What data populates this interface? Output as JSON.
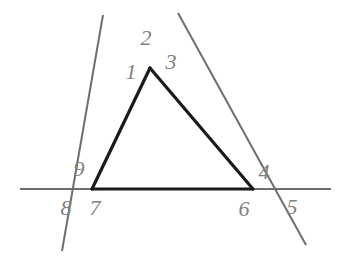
{
  "figure": {
    "background_color": "#ffffff",
    "triangle_color": "#1a1a1a",
    "line_color": "#6e6e6e",
    "label_color": "#808080",
    "triangle": {
      "apex": {
        "x": 150,
        "y": 68
      },
      "bottom_left": {
        "x": 92,
        "y": 189
      },
      "bottom_right": {
        "x": 253,
        "y": 189
      }
    },
    "lines": [
      {
        "name": "horizontal-base-line",
        "x1": 20,
        "y1": 189,
        "x2": 331,
        "y2": 189
      },
      {
        "name": "left-transversal-line",
        "x1": 103,
        "y1": 15,
        "x2": 62,
        "y2": 251
      },
      {
        "name": "right-transversal-line",
        "x1": 178,
        "y1": 13,
        "x2": 306,
        "y2": 245
      }
    ],
    "labels": [
      {
        "text": "1",
        "x": 131,
        "y": 72
      },
      {
        "text": "2",
        "x": 146,
        "y": 38
      },
      {
        "text": "3",
        "x": 171,
        "y": 62
      },
      {
        "text": "4",
        "x": 264,
        "y": 172
      },
      {
        "text": "5",
        "x": 292,
        "y": 207
      },
      {
        "text": "6",
        "x": 244,
        "y": 209
      },
      {
        "text": "7",
        "x": 95,
        "y": 208
      },
      {
        "text": "8",
        "x": 66,
        "y": 208
      },
      {
        "text": "9",
        "x": 79,
        "y": 169
      }
    ]
  }
}
